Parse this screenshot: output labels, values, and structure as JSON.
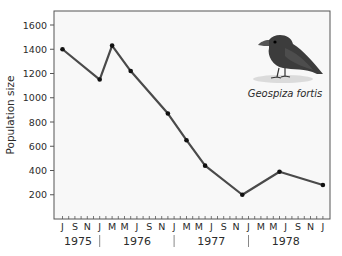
{
  "chart_data": {
    "type": "line",
    "title": "",
    "xlabel": "",
    "ylabel": "Population size",
    "ylim": [
      0,
      1700
    ],
    "yticks": [
      200,
      400,
      600,
      800,
      1000,
      1200,
      1400,
      1600
    ],
    "x_start": "1975-07",
    "x_end": "1979-01",
    "month_tick_labels": [
      "J",
      "S",
      "N",
      "J",
      "M",
      "M",
      "J",
      "S",
      "N",
      "J",
      "M",
      "M",
      "J",
      "S",
      "N",
      "J",
      "M",
      "M",
      "J",
      "S",
      "N",
      "J"
    ],
    "year_labels": [
      "1975",
      "1976",
      "1977",
      "1978"
    ],
    "year_separator": "|",
    "grid": false,
    "legend": "none",
    "annotation": "Geospiza fortis",
    "series": [
      {
        "name": "Geospiza fortis",
        "points": [
          {
            "date": "1975-07",
            "value": 1400
          },
          {
            "date": "1976-01",
            "value": 1150
          },
          {
            "date": "1976-03",
            "value": 1430
          },
          {
            "date": "1976-06",
            "value": 1220
          },
          {
            "date": "1976-12",
            "value": 870
          },
          {
            "date": "1977-03",
            "value": 650
          },
          {
            "date": "1977-06",
            "value": 440
          },
          {
            "date": "1977-12",
            "value": 200
          },
          {
            "date": "1978-06",
            "value": 390
          },
          {
            "date": "1979-01",
            "value": 280
          }
        ]
      }
    ],
    "colors": {
      "line": "#4a4a4a",
      "marker": "#111111",
      "frame": "#555555",
      "plot_background": "#f8f8f8"
    }
  }
}
